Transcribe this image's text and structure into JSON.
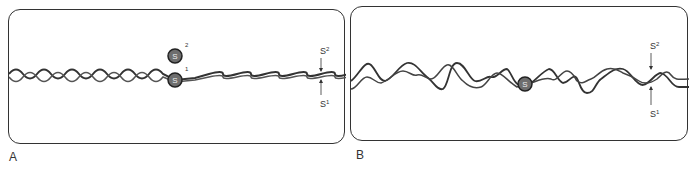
{
  "panels": [
    {
      "id": "A",
      "label": "A",
      "description": "Regular double helix with a single bond site",
      "markers": {
        "upper": {
          "symbol": "S",
          "superscript": "2"
        },
        "lower": {
          "symbol": "S",
          "superscript": "1"
        }
      },
      "bead_upper": {
        "symbol": "S",
        "index": "2"
      },
      "bead_lower": {
        "symbol": "S",
        "index": "1"
      }
    },
    {
      "id": "B",
      "label": "B",
      "description": "Irregular intertwined strands with a single bond site",
      "markers": {
        "upper": {
          "symbol": "S",
          "superscript": "2"
        },
        "lower": {
          "symbol": "S",
          "superscript": "1"
        }
      },
      "bead": {
        "symbol": "S"
      }
    }
  ],
  "colors": {
    "stroke": "#333333",
    "bead_fill": "#6e6e6e",
    "bead_ring": "#222222",
    "background": "#ffffff"
  }
}
